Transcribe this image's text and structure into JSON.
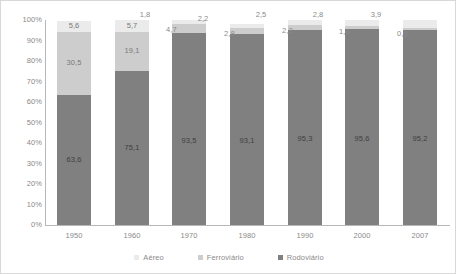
{
  "chart_data": {
    "type": "bar",
    "subtype": "stacked-bar-100",
    "title": "",
    "xlabel": "",
    "ylabel": "",
    "ylim": [
      0,
      100
    ],
    "grid": false,
    "legend_position": "bottom",
    "categories": [
      "1950",
      "1960",
      "1970",
      "1980",
      "1990",
      "2000",
      "2007"
    ],
    "ytick_labels": [
      "100%",
      "90%",
      "80%",
      "70%",
      "60%",
      "50%",
      "40%",
      "30%",
      "20%",
      "10%",
      "0%"
    ],
    "ytick_values": [
      100,
      90,
      80,
      70,
      60,
      50,
      40,
      30,
      20,
      10,
      0
    ],
    "series": [
      {
        "name": "Rodoviário",
        "color": "#808080",
        "values": [
          63.6,
          75.1,
          93.5,
          93.1,
          95.3,
          95.6,
          95.2
        ],
        "labels": [
          "63,6",
          "75,1",
          "93,5",
          "93,1",
          "95,3",
          "95,6",
          "95,2"
        ]
      },
      {
        "name": "Ferroviário",
        "color": "#cdcdcd",
        "values": [
          30.5,
          19.1,
          4.7,
          2.8,
          2.2,
          1.6,
          0.9
        ],
        "labels": [
          "30,5",
          "19,1",
          "4,7",
          "2,8",
          "2,2",
          "1,6",
          "0,9"
        ]
      },
      {
        "name": "Aéreo",
        "color": "#ebebeb",
        "values": [
          5.6,
          5.7,
          1.8,
          2.2,
          2.5,
          2.8,
          3.9
        ],
        "labels": [
          "5,6",
          "5,7",
          "1,8",
          "2,2",
          "2,5",
          "2,8",
          "3,9"
        ]
      }
    ]
  },
  "legend": {
    "items": [
      {
        "label": "Aéreo",
        "color": "#ebebeb"
      },
      {
        "label": "Ferroviário",
        "color": "#cdcdcd"
      },
      {
        "label": "Rodoviário",
        "color": "#808080"
      }
    ]
  }
}
